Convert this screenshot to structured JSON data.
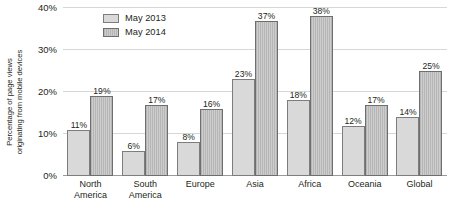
{
  "chart_data": {
    "type": "bar",
    "title": "",
    "xlabel": "",
    "ylabel": "Percentage of page views originating from mobile devices",
    "ylabel_lines": [
      "Percentage of page views",
      "originating from mobile devices"
    ],
    "categories": [
      "North America",
      "South America",
      "Europe",
      "Asia",
      "Africa",
      "Oceania",
      "Global"
    ],
    "category_lines": [
      [
        "North",
        "America"
      ],
      [
        "South",
        "America"
      ],
      [
        "Europe"
      ],
      [
        "Asia"
      ],
      [
        "Africa"
      ],
      [
        "Oceania"
      ],
      [
        "Global"
      ]
    ],
    "series": [
      {
        "name": "May 2013",
        "values": [
          11,
          6,
          8,
          23,
          18,
          12,
          14
        ],
        "labels": [
          "11%",
          "6%",
          "8%",
          "23%",
          "18%",
          "12%",
          "14%"
        ],
        "fill": "#d9d9d9",
        "pattern": "solid"
      },
      {
        "name": "May 2014",
        "values": [
          19,
          17,
          16,
          37,
          38,
          17,
          25
        ],
        "labels": [
          "19%",
          "17%",
          "16%",
          "37%",
          "38%",
          "17%",
          "25%"
        ],
        "fill": "#c4c4c4",
        "pattern": "vertical-stripes"
      }
    ],
    "ylim": [
      0,
      40
    ],
    "ytick_values": [
      0,
      10,
      20,
      30,
      40
    ],
    "ytick_labels": [
      "0%",
      "10%",
      "20%",
      "30%",
      "40%"
    ],
    "grid": true,
    "grid_color": "#d7d7d7",
    "axis_color": "#9a9a9a",
    "legend_position": "top-left-inside",
    "legend": [
      "May 2013",
      "May 2014"
    ]
  }
}
